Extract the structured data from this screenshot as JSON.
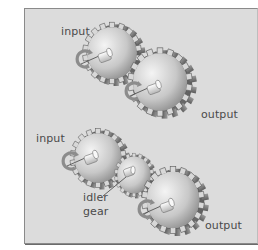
{
  "diagram": {
    "top": {
      "input_label": "input",
      "output_label": "output"
    },
    "bottom": {
      "input_label": "input",
      "idler_label_line1": "idler",
      "idler_label_line2": "gear",
      "output_label": "output"
    }
  },
  "colors": {
    "panel_bg": "#dcdcdc",
    "border": "#8a8a8a",
    "gear_light": "#f2f2f2",
    "gear_dark": "#7a7a7a",
    "label": "#4a4a4a"
  }
}
